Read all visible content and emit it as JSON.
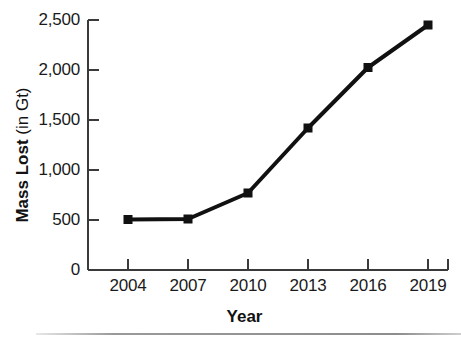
{
  "chart_data": {
    "type": "line",
    "title": "",
    "xlabel": "Year",
    "ylabel": "Mass Lost (in Gt)",
    "ylabel_bold_part": "Mass Lost",
    "ylabel_regular_part": "(in Gt)",
    "x": [
      2004,
      2007,
      2010,
      2013,
      2016,
      2019
    ],
    "categories": [
      "2004",
      "2007",
      "2010",
      "2013",
      "2016",
      "2019"
    ],
    "values": [
      505,
      510,
      770,
      1420,
      2025,
      2450
    ],
    "series": [
      {
        "name": "Mass Lost",
        "values": [
          505,
          510,
          770,
          1420,
          2025,
          2450
        ]
      }
    ],
    "xlim": [
      2002.5,
      2020.5
    ],
    "ylim": [
      0,
      2500
    ],
    "xtick_labels": [
      "2004",
      "2007",
      "2010",
      "2013",
      "2016",
      "2019"
    ],
    "ytick_values": [
      0,
      500,
      1000,
      1500,
      2000,
      2500
    ],
    "ytick_labels": [
      "0",
      "500",
      "1,000",
      "1,500",
      "2,000",
      "2,500"
    ],
    "grid": false,
    "legend": false,
    "legend_position": "none",
    "marker": "square",
    "line_color": "#111111",
    "marker_color": "#111111",
    "background_color": "#ffffff",
    "axis_color": "#3a3a3a"
  }
}
